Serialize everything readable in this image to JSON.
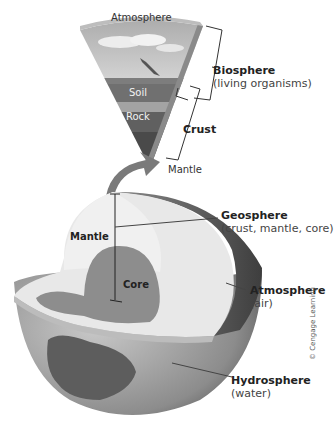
{
  "wedge": {
    "layers": [
      {
        "label": "Atmosphere"
      },
      {
        "label": "Soil"
      },
      {
        "label": "Rock"
      }
    ],
    "mantle_label": "Mantle"
  },
  "brackets": {
    "biosphere": {
      "title": "Biosphere",
      "subtitle": "(living organisms)"
    },
    "crust": {
      "title": "Crust"
    }
  },
  "globe": {
    "mantle_label": "Mantle",
    "core_label": "Core",
    "geosphere": {
      "title": "Geosphere",
      "subtitle": "(crust, mantle, core)"
    },
    "atmosphere": {
      "title": "Atmosphere",
      "subtitle": "(air)"
    },
    "hydrosphere": {
      "title": "Hydrosphere",
      "subtitle": "(water)"
    }
  },
  "credit": "© Cengage Learning",
  "colors": {
    "sky": "#c9c9c9",
    "soil": "#6f6f6f",
    "rock": "#5e5e5e",
    "mantle": "#e9e9e9",
    "core": "#8a8a8a",
    "ocean": "#9a9a9a",
    "land": "#5a5a5a"
  }
}
